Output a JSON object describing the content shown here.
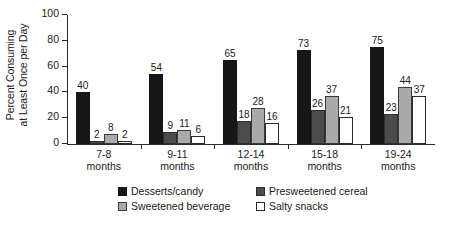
{
  "chart_data": {
    "type": "bar",
    "title": "",
    "subtitle": "",
    "xlabel": "",
    "ylabel_line1": "Percent Consuming",
    "ylabel_line2": "at Least Once per Day",
    "ylim": [
      0,
      100
    ],
    "yticks": [
      0,
      20,
      40,
      60,
      80,
      100
    ],
    "ytick_labels": [
      "0",
      "20",
      "40",
      "60",
      "80",
      "100"
    ],
    "grid": false,
    "legend_position": "bottom",
    "categories": [
      "7-8 months",
      "9-11 months",
      "12-14 months",
      "15-18 months",
      "19-24 months"
    ],
    "category_lines": [
      [
        "7-8",
        "months"
      ],
      [
        "9-11",
        "months"
      ],
      [
        "12-14",
        "months"
      ],
      [
        "15-18",
        "months"
      ],
      [
        "19-24",
        "months"
      ]
    ],
    "series": [
      {
        "name": "Desserts/candy",
        "color": "#161616",
        "values": [
          40,
          54,
          65,
          73,
          75
        ]
      },
      {
        "name": "Presweetened cereal",
        "color": "#4b4b4b",
        "values": [
          2,
          9,
          18,
          26,
          23
        ]
      },
      {
        "name": "Sweetened beverage",
        "color": "#aaaaaa",
        "values": [
          8,
          11,
          28,
          37,
          44
        ]
      },
      {
        "name": "Salty snacks",
        "color": "#ffffff",
        "values": [
          2,
          6,
          16,
          21,
          37
        ]
      }
    ],
    "value_labels_shown": true
  },
  "legend": {
    "items": [
      {
        "label": "Desserts/candy",
        "swatch": "black-filled-square-icon"
      },
      {
        "label": "Presweetened cereal",
        "swatch": "dark-gray-filled-square-icon"
      },
      {
        "label": "Sweetened beverage",
        "swatch": "light-gray-filled-square-icon"
      },
      {
        "label": "Salty snacks",
        "swatch": "white-outlined-square-icon"
      }
    ]
  }
}
